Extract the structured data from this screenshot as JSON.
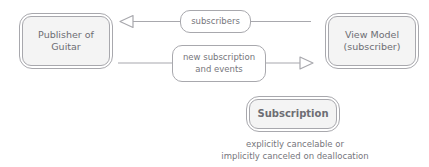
{
  "diagram": {
    "type": "flow-diagram",
    "nodes": [
      {
        "id": "publisher",
        "label": "Publisher of\nGuitar",
        "role": "publisher"
      },
      {
        "id": "view-model",
        "label": "View Model\n(subscriber)",
        "role": "subscriber"
      },
      {
        "id": "subscription",
        "label": "Subscription",
        "role": "subscription"
      }
    ],
    "edges": [
      {
        "id": "subscribers-edge",
        "label": "subscribers",
        "from": "view-model",
        "to": "publisher",
        "direction": "right-to-left",
        "arrowhead": "hollow-triangle"
      },
      {
        "id": "new-subscription-edge",
        "label": "new subscription\nand events",
        "from": "publisher",
        "to": "view-model",
        "direction": "left-to-right",
        "arrowhead": "hollow-triangle"
      }
    ],
    "caption": "explicitly cancelable or\nimplicitly canceled on deallocation",
    "colors": {
      "node_fill": "#f4f4f4",
      "stroke": "#a8a8ad",
      "text": "#6d6d73",
      "caption_text": "#76767c",
      "background": "#ffffff"
    }
  }
}
